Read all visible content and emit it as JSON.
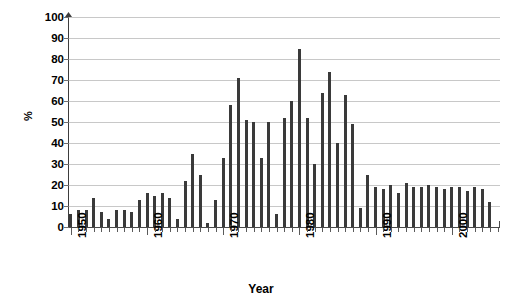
{
  "chart_data": {
    "type": "bar",
    "title": "",
    "xlabel": "Year",
    "ylabel": "%",
    "ylim": [
      0,
      100
    ],
    "ytick_labels": [
      "100",
      "90",
      "80",
      "70",
      "60",
      "50",
      "40",
      "30",
      "20",
      "10",
      "0"
    ],
    "ytick_values": [
      100,
      90,
      80,
      70,
      60,
      50,
      40,
      30,
      20,
      10,
      0
    ],
    "xtick_labels": [
      "1950",
      "1960",
      "1970",
      "1980",
      "1990",
      "2000"
    ],
    "xtick_values": [
      1950,
      1960,
      1970,
      1980,
      1990,
      2000
    ],
    "xlim": [
      1949.5,
      2005.5
    ],
    "grid": "horizontal",
    "legend": "none",
    "bar_color": "#3a3a3a",
    "gridline_color": "#c8c8c8",
    "axis_color": "#4a4a4a",
    "categories": [
      1950,
      1951,
      1952,
      1953,
      1954,
      1955,
      1956,
      1957,
      1958,
      1959,
      1960,
      1961,
      1962,
      1963,
      1964,
      1965,
      1966,
      1967,
      1968,
      1969,
      1970,
      1971,
      1972,
      1973,
      1974,
      1975,
      1976,
      1977,
      1978,
      1979,
      1980,
      1981,
      1982,
      1983,
      1984,
      1985,
      1986,
      1987,
      1988,
      1989,
      1990,
      1991,
      1992,
      1993,
      1994,
      1995,
      1996,
      1997,
      1998,
      1999,
      2000,
      2001,
      2002,
      2003,
      2004,
      2005
    ],
    "values": [
      6,
      8,
      8,
      14,
      7,
      4,
      8,
      8,
      7,
      13,
      16,
      15,
      16,
      14,
      4,
      22,
      35,
      25,
      2,
      13,
      33,
      58,
      71,
      51,
      50,
      33,
      50,
      6,
      52,
      60,
      85,
      52,
      30,
      64,
      74,
      40,
      63,
      49,
      9,
      25,
      19,
      18,
      20,
      16,
      21,
      19,
      19,
      20,
      19,
      18,
      19,
      19,
      17,
      19,
      18,
      12
    ],
    "units": "percent"
  }
}
